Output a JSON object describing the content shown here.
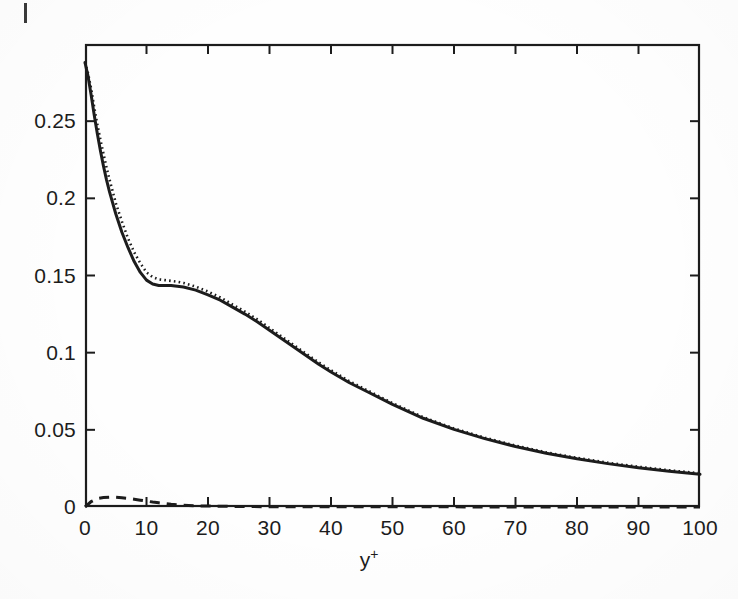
{
  "figure": {
    "background_color": "#fefefe",
    "ink_color": "#1c1c1c",
    "corner_artifact_name": "scan-edge-mark"
  },
  "axes": {
    "x_title_base": "y",
    "x_title_sup": "+",
    "y_title": "",
    "x_tick_labels": [
      "0",
      "10",
      "20",
      "30",
      "40",
      "50",
      "60",
      "70",
      "80",
      "90",
      "100"
    ],
    "y_tick_labels": [
      "0",
      "0.05",
      "0.1",
      "0.15",
      "0.2",
      "0.25"
    ],
    "frame": "box"
  },
  "chart_data": {
    "type": "line",
    "title": "",
    "xlabel": "y+",
    "ylabel": "",
    "xlim": [
      0,
      100
    ],
    "ylim": [
      0,
      0.3
    ],
    "xticks": [
      0,
      10,
      20,
      30,
      40,
      50,
      60,
      70,
      80,
      90,
      100
    ],
    "yticks": [
      0,
      0.05,
      0.1,
      0.15,
      0.2,
      0.25
    ],
    "grid": false,
    "legend": "none",
    "series": [
      {
        "name": "solid-curve",
        "style": "solid",
        "color": "#1c1c1c",
        "x": [
          0,
          0.5,
          1,
          1.5,
          2,
          2.5,
          3,
          3.5,
          4,
          5,
          6,
          7,
          8,
          9,
          10,
          11,
          12,
          13,
          14,
          15,
          16,
          18,
          20,
          22,
          24,
          26,
          28,
          30,
          32,
          34,
          36,
          38,
          40,
          43,
          46,
          50,
          55,
          60,
          65,
          70,
          75,
          80,
          85,
          90,
          95,
          100
        ],
        "y": [
          0.288,
          0.279,
          0.267,
          0.254,
          0.242,
          0.231,
          0.221,
          0.212,
          0.204,
          0.19,
          0.178,
          0.168,
          0.159,
          0.152,
          0.147,
          0.1445,
          0.1435,
          0.1435,
          0.1435,
          0.143,
          0.1425,
          0.1405,
          0.1375,
          0.134,
          0.1295,
          0.125,
          0.12,
          0.1145,
          0.109,
          0.1035,
          0.098,
          0.0925,
          0.0875,
          0.0805,
          0.0745,
          0.0665,
          0.0575,
          0.0503,
          0.0443,
          0.0392,
          0.0348,
          0.0312,
          0.0281,
          0.0255,
          0.0232,
          0.0212
        ]
      },
      {
        "name": "dotted-curve",
        "style": "dotted",
        "color": "#1c1c1c",
        "x": [
          0,
          0.5,
          1,
          1.5,
          2,
          2.5,
          3,
          3.5,
          4,
          5,
          6,
          7,
          8,
          9,
          10,
          11,
          12,
          13,
          14,
          15,
          16,
          18,
          20,
          22,
          24,
          26,
          28,
          30,
          32,
          34,
          36,
          38,
          40,
          43,
          46,
          50,
          55,
          60,
          65,
          70,
          75,
          80,
          85,
          90,
          95,
          100
        ],
        "y": [
          0.288,
          0.281,
          0.271,
          0.259,
          0.248,
          0.238,
          0.229,
          0.22,
          0.212,
          0.197,
          0.185,
          0.174,
          0.165,
          0.158,
          0.152,
          0.149,
          0.1475,
          0.147,
          0.1465,
          0.146,
          0.1452,
          0.1428,
          0.1396,
          0.1358,
          0.1312,
          0.1266,
          0.1216,
          0.116,
          0.1104,
          0.1048,
          0.0992,
          0.0937,
          0.0886,
          0.0815,
          0.0754,
          0.0673,
          0.0582,
          0.0509,
          0.0449,
          0.0398,
          0.0354,
          0.0318,
          0.0287,
          0.0261,
          0.0238,
          0.0218
        ]
      },
      {
        "name": "dashed-curve",
        "style": "dashed",
        "color": "#1c1c1c",
        "x": [
          0,
          1,
          2,
          3,
          4,
          5,
          6,
          7,
          8,
          9,
          10,
          11,
          12,
          13,
          14,
          15,
          16,
          18,
          20,
          25,
          30,
          40,
          50,
          60,
          70,
          80,
          90,
          100
        ],
        "y": [
          0.0,
          0.0035,
          0.0055,
          0.0062,
          0.0064,
          0.0063,
          0.006,
          0.0056,
          0.005,
          0.0044,
          0.0038,
          0.0032,
          0.0027,
          0.0022,
          0.0018,
          0.0015,
          0.0012,
          0.0008,
          0.0006,
          0.0003,
          0.0002,
          0.0001,
          0.0001,
          0.0001,
          0.0,
          0.0,
          0.0,
          0.0
        ]
      }
    ]
  }
}
